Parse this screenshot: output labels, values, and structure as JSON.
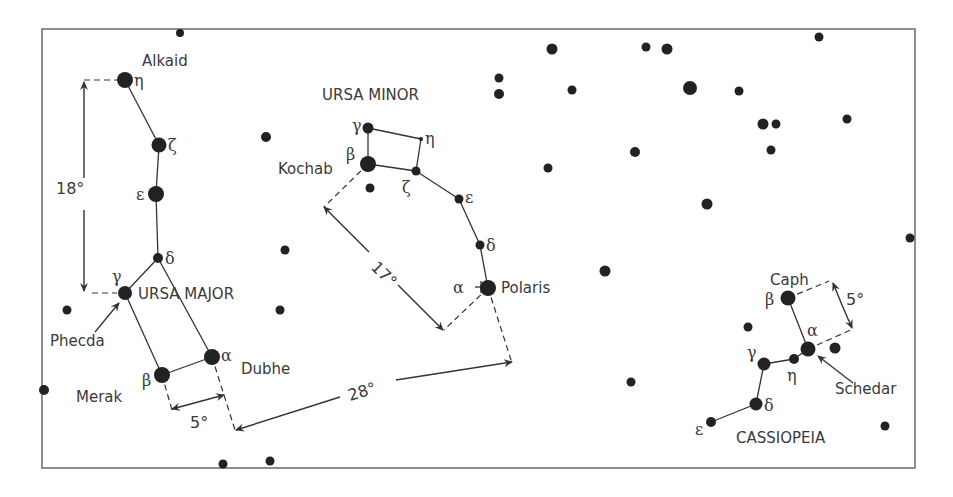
{
  "colors": {
    "ink": "#333333",
    "text": "#3a3a3a",
    "frame": "#6a6a6a",
    "background": "#ffffff"
  },
  "frame": {
    "x": 42,
    "y": 29,
    "w": 873,
    "h": 439
  },
  "constellations": [
    {
      "name": "URSA MAJOR",
      "label": {
        "text": "URSA MAJOR",
        "x": 138,
        "y": 299
      },
      "stars": [
        {
          "id": "eta",
          "greek": "η",
          "name": "Alkaid",
          "x": 125,
          "y": 80,
          "r": 8,
          "gx": 134,
          "gy": 86
        },
        {
          "id": "zeta",
          "greek": "ζ",
          "x": 159,
          "y": 145,
          "r": 7.5,
          "gx": 168,
          "gy": 151
        },
        {
          "id": "eps",
          "greek": "ε",
          "x": 156,
          "y": 194,
          "r": 8,
          "gx": 136,
          "gy": 200
        },
        {
          "id": "delta",
          "greek": "δ",
          "x": 158,
          "y": 258,
          "r": 5,
          "gx": 165,
          "gy": 264
        },
        {
          "id": "gamma",
          "greek": "γ",
          "name": "Phecda",
          "x": 125,
          "y": 293,
          "r": 7,
          "gx": 112,
          "gy": 282
        },
        {
          "id": "beta",
          "greek": "β",
          "name": "Merak",
          "x": 162,
          "y": 375,
          "r": 8,
          "gx": 142,
          "gy": 386
        },
        {
          "id": "alpha",
          "greek": "α",
          "name": "Dubhe",
          "x": 212,
          "y": 357,
          "r": 8,
          "gx": 221,
          "gy": 361
        }
      ],
      "lines": [
        [
          "eta",
          "zeta"
        ],
        [
          "zeta",
          "eps"
        ],
        [
          "eps",
          "delta"
        ],
        [
          "delta",
          "gamma"
        ],
        [
          "gamma",
          "beta"
        ],
        [
          "beta",
          "alpha"
        ],
        [
          "alpha",
          "delta"
        ]
      ]
    },
    {
      "name": "URSA MINOR",
      "label": {
        "text": "URSA MINOR",
        "x": 322,
        "y": 100
      },
      "stars": [
        {
          "id": "gamma",
          "greek": "γ",
          "x": 368,
          "y": 128,
          "r": 5.5,
          "gx": 352,
          "gy": 131
        },
        {
          "id": "eta",
          "greek": "η",
          "x": 421,
          "y": 139,
          "r": 2,
          "gx": 425,
          "gy": 144
        },
        {
          "id": "beta",
          "greek": "β",
          "name": "Kochab",
          "x": 368,
          "y": 164,
          "r": 8,
          "gx": 346,
          "gy": 160
        },
        {
          "id": "zeta",
          "greek": "ζ",
          "x": 416,
          "y": 171,
          "r": 4.5,
          "gx": 402,
          "gy": 193
        },
        {
          "id": "eps",
          "greek": "ε",
          "x": 459,
          "y": 199,
          "r": 4.5,
          "gx": 465,
          "gy": 203
        },
        {
          "id": "delta",
          "greek": "δ",
          "x": 480,
          "y": 245,
          "r": 4.5,
          "gx": 486,
          "gy": 251
        },
        {
          "id": "alpha",
          "greek": "α",
          "name": "Polaris",
          "x": 488,
          "y": 288,
          "r": 8,
          "gx": 453,
          "gy": 293
        }
      ],
      "lines": [
        [
          "gamma",
          "eta"
        ],
        [
          "gamma",
          "beta"
        ],
        [
          "beta",
          "zeta"
        ],
        [
          "eta",
          "zeta"
        ],
        [
          "zeta",
          "eps"
        ],
        [
          "eps",
          "delta"
        ],
        [
          "delta",
          "alpha"
        ]
      ]
    },
    {
      "name": "CASSIOPEIA",
      "label": {
        "text": "CASSIOPEIA",
        "x": 736,
        "y": 443
      },
      "stars": [
        {
          "id": "beta",
          "greek": "β",
          "name": "Caph",
          "x": 788,
          "y": 298,
          "r": 7.5,
          "gx": 765,
          "gy": 305
        },
        {
          "id": "alpha",
          "greek": "α",
          "name": "Schedar",
          "x": 808,
          "y": 349,
          "r": 7.5,
          "gx": 807,
          "gy": 336
        },
        {
          "id": "eta",
          "greek": "η",
          "x": 794,
          "y": 359,
          "r": 5,
          "gx": 787,
          "gy": 381
        },
        {
          "id": "gamma",
          "greek": "γ",
          "x": 764,
          "y": 364,
          "r": 6.5,
          "gx": 747,
          "gy": 358
        },
        {
          "id": "delta",
          "greek": "δ",
          "x": 756,
          "y": 404,
          "r": 6.5,
          "gx": 764,
          "gy": 411
        },
        {
          "id": "eps",
          "greek": "ε",
          "x": 711,
          "y": 422,
          "r": 5,
          "gx": 695,
          "gy": 435
        }
      ],
      "lines": [
        [
          "beta",
          "alpha"
        ],
        [
          "alpha",
          "eta"
        ],
        [
          "eta",
          "gamma"
        ],
        [
          "gamma",
          "delta"
        ],
        [
          "delta",
          "eps"
        ]
      ]
    }
  ],
  "star_names": [
    {
      "text": "Alkaid",
      "x": 142,
      "y": 66
    },
    {
      "text": "Phecda",
      "x": 50,
      "y": 346
    },
    {
      "text": "Merak",
      "x": 76,
      "y": 402
    },
    {
      "text": "Dubhe",
      "x": 241,
      "y": 374
    },
    {
      "text": "Kochab",
      "x": 278,
      "y": 174
    },
    {
      "text": "Polaris",
      "x": 501,
      "y": 293
    },
    {
      "text": "Caph",
      "x": 770,
      "y": 285
    },
    {
      "text": "Schedar",
      "x": 835,
      "y": 394
    }
  ],
  "field_stars": [
    [
      180,
      33,
      4
    ],
    [
      266,
      137,
      5
    ],
    [
      285,
      250,
      4.5
    ],
    [
      280,
      310,
      4.5
    ],
    [
      67,
      310,
      4.5
    ],
    [
      44,
      390,
      5
    ],
    [
      370,
      188,
      4.5
    ],
    [
      223,
      464,
      4.5
    ],
    [
      270,
      461,
      4.5
    ],
    [
      552,
      49,
      5.5
    ],
    [
      499,
      78,
      4.5
    ],
    [
      499,
      94,
      5
    ],
    [
      572,
      90,
      4.5
    ],
    [
      548,
      168,
      4.5
    ],
    [
      635,
      152,
      5
    ],
    [
      605,
      271,
      5.5
    ],
    [
      707,
      204,
      5.5
    ],
    [
      646,
      47,
      4.5
    ],
    [
      667,
      49,
      5.5
    ],
    [
      690,
      88,
      7
    ],
    [
      739,
      91,
      4.5
    ],
    [
      819,
      37,
      4.5
    ],
    [
      763,
      124,
      5.5
    ],
    [
      776,
      124,
      4.5
    ],
    [
      771,
      150,
      4.5
    ],
    [
      847,
      119,
      4.5
    ],
    [
      910,
      238,
      4.5
    ],
    [
      748,
      327,
      4.5
    ],
    [
      835,
      348,
      5.5
    ],
    [
      631,
      382,
      4.5
    ],
    [
      885,
      426,
      4.5
    ]
  ],
  "polaris_marker": {
    "symbol": "+",
    "x": 481,
    "y": 287
  },
  "dashed_guides": [
    [
      [
        84,
        80
      ],
      [
        117,
        80
      ]
    ],
    [
      [
        92,
        293
      ],
      [
        117,
        293
      ]
    ],
    [
      [
        162,
        375
      ],
      [
        172,
        410
      ]
    ],
    [
      [
        212,
        357
      ],
      [
        235,
        430
      ]
    ],
    [
      [
        368,
        164
      ],
      [
        324,
        207
      ]
    ],
    [
      [
        488,
        288
      ],
      [
        444,
        330
      ]
    ],
    [
      [
        488,
        288
      ],
      [
        512,
        363
      ]
    ],
    [
      [
        788,
        298
      ],
      [
        829,
        281
      ]
    ],
    [
      [
        808,
        349
      ],
      [
        853,
        329
      ]
    ]
  ],
  "measurements": [
    {
      "label": "18°",
      "angle": 0,
      "lx": 56,
      "ly": 194,
      "arrows": [
        {
          "from": [
            84,
            178
          ],
          "to": [
            84,
            82
          ]
        },
        {
          "from": [
            84,
            210
          ],
          "to": [
            84,
            291
          ]
        }
      ]
    },
    {
      "label": "17°",
      "angle": 45,
      "lx": 370,
      "ly": 268,
      "arrows": [
        {
          "from": [
            369,
            252
          ],
          "to": [
            324,
            207
          ]
        },
        {
          "from": [
            398,
            285
          ],
          "to": [
            443,
            330
          ]
        }
      ]
    },
    {
      "label": "28°",
      "angle": -17,
      "lx": 350,
      "ly": 401,
      "arrows": [
        {
          "from": [
            340,
            397
          ],
          "to": [
            236,
            430
          ]
        },
        {
          "from": [
            396,
            380
          ],
          "to": [
            512,
            362
          ]
        }
      ]
    },
    {
      "label": "5°",
      "angle": 0,
      "lx": 190,
      "ly": 428,
      "arrows": [
        {
          "from": [
            198,
            402
          ],
          "to": [
            172,
            409
          ]
        },
        {
          "from": [
            198,
            402
          ],
          "to": [
            224,
            395
          ]
        }
      ]
    },
    {
      "label": "5°",
      "angle": 0,
      "lx": 846,
      "ly": 305,
      "arrows": [
        {
          "from": [
            842,
            305
          ],
          "to": [
            833,
            283
          ]
        },
        {
          "from": [
            842,
            305
          ],
          "to": [
            852,
            328
          ]
        }
      ]
    }
  ],
  "pointer_arrows": [
    {
      "name": "phecda-pointer",
      "from": [
        95,
        332
      ],
      "to": [
        119,
        303
      ]
    },
    {
      "name": "schedar-pointer",
      "from": [
        853,
        383
      ],
      "to": [
        818,
        356
      ]
    }
  ]
}
